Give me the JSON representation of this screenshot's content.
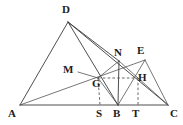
{
  "figure": {
    "canvas": {
      "width": 183,
      "height": 125
    },
    "stroke_color": "#3a3a3a",
    "dash_color": "#555555",
    "label_color": "#1c1c1c",
    "background": "#ffffff"
  },
  "points": [
    {
      "id": "A",
      "label": "A",
      "x": 20,
      "y": 105,
      "label_x": 8,
      "label_y": 108
    },
    {
      "id": "D",
      "label": "D",
      "x": 68,
      "y": 22,
      "label_x": 62,
      "label_y": 4
    },
    {
      "id": "C",
      "label": "C",
      "x": 168,
      "y": 105,
      "label_x": 170,
      "label_y": 108
    },
    {
      "id": "S",
      "label": "S",
      "x": 100,
      "y": 105,
      "label_x": 96,
      "label_y": 108
    },
    {
      "id": "B",
      "label": "B",
      "x": 118,
      "y": 105,
      "label_x": 113,
      "label_y": 108
    },
    {
      "id": "T",
      "label": "T",
      "x": 138,
      "y": 105,
      "label_x": 132,
      "label_y": 108
    },
    {
      "id": "G",
      "label": "G",
      "x": 98,
      "y": 78,
      "label_x": 92,
      "label_y": 78
    },
    {
      "id": "M",
      "label": "M",
      "x": 78,
      "y": 72,
      "label_x": 63,
      "label_y": 64
    },
    {
      "id": "N",
      "label": "N",
      "x": 119,
      "y": 61,
      "label_x": 114,
      "label_y": 47
    },
    {
      "id": "E",
      "label": "E",
      "x": 145,
      "y": 60,
      "label_x": 137,
      "label_y": 45
    },
    {
      "id": "H",
      "label": "H",
      "x": 138,
      "y": 78,
      "label_x": 138,
      "label_y": 72
    }
  ],
  "segments": [
    {
      "name": "AC-base",
      "from": "A",
      "to": "C",
      "style": "solid"
    },
    {
      "name": "AD-side",
      "from": "A",
      "to": "D",
      "style": "solid"
    },
    {
      "name": "DC-side",
      "from": "D",
      "to": "C",
      "style": "solid"
    },
    {
      "name": "DB-cevian",
      "from": "D",
      "to": "B",
      "style": "solid"
    },
    {
      "name": "DN-line",
      "from": "D",
      "to": "N",
      "style": "solid"
    },
    {
      "name": "AE-line",
      "from": "A",
      "to": "E",
      "style": "thin"
    },
    {
      "name": "NB-line",
      "from": "N",
      "to": "B",
      "style": "solid"
    },
    {
      "name": "NH-line",
      "from": "N",
      "to": "H",
      "style": "thin"
    },
    {
      "name": "EB-line",
      "from": "E",
      "to": "B",
      "style": "thin"
    },
    {
      "name": "EC-line",
      "from": "E",
      "to": "C",
      "style": "thin"
    },
    {
      "name": "GB-line",
      "from": "G",
      "to": "B",
      "style": "thin"
    },
    {
      "name": "GN-line",
      "from": "G",
      "to": "N",
      "style": "thin"
    },
    {
      "name": "HC-line",
      "from": "H",
      "to": "C",
      "style": "thin"
    },
    {
      "name": "MG-hidden",
      "from": "M",
      "to": "G",
      "style": "thin"
    }
  ],
  "dashed_segments": [
    {
      "name": "GH-horizontal-dashed",
      "from": "G",
      "to": "H",
      "style": "dashed"
    },
    {
      "name": "GS-vertical-dashed",
      "from": "G",
      "to": "S",
      "style": "dashed"
    },
    {
      "name": "HT-vertical-dashed",
      "from": "H",
      "to": "T",
      "style": "dashed"
    }
  ]
}
